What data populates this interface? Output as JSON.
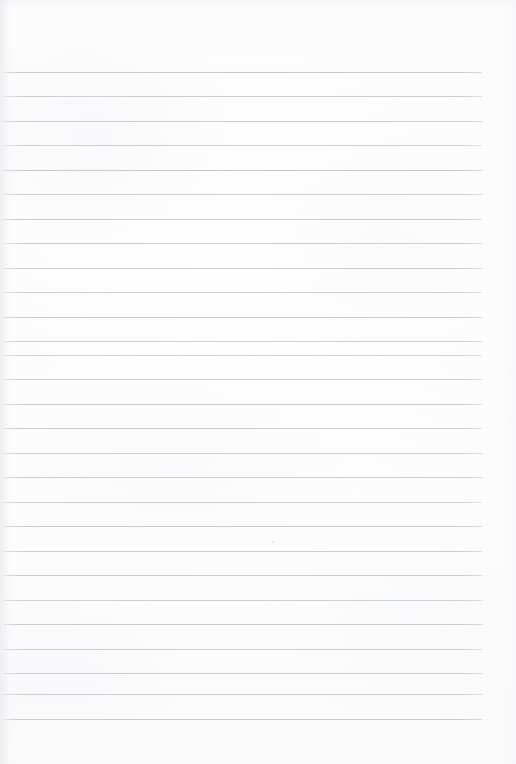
{
  "document": {
    "kind": "scanned-ruled-paper",
    "title": "Blank ruled notebook page",
    "content_text": "",
    "has_handwriting": false,
    "orientation": "portrait",
    "page_width_px": 516,
    "page_height_px": 764
  },
  "paper": {
    "background_color": "#fdfdfe",
    "edge_shadow_color": "#e1e3e8",
    "texture": "fine paper grain with soft scan vignette"
  },
  "ruling": {
    "style": "horizontal ruled lines",
    "line_color": "#b9bdc5",
    "line_color_light": "#d2d5db",
    "line_thickness_px": 1,
    "line_count": 27,
    "first_line_y": 72,
    "line_spacing_px": 24.5,
    "line_start_x": 3,
    "line_end_x": 483,
    "top_margin_px": 72,
    "bottom_margin_px": 44,
    "left_margin_px": 3,
    "right_margin_px": 33,
    "has_vertical_margin_rule": false
  },
  "lines": [
    {
      "index": 1,
      "y": 71.5,
      "x1": 4,
      "x2": 482,
      "opacity": 0.8
    },
    {
      "index": 2,
      "y": 96.0,
      "x1": 4,
      "x2": 483,
      "opacity": 0.72
    },
    {
      "index": 3,
      "y": 120.5,
      "x1": 3,
      "x2": 483,
      "opacity": 0.78
    },
    {
      "index": 4,
      "y": 145.0,
      "x1": 4,
      "x2": 482,
      "opacity": 0.7
    },
    {
      "index": 5,
      "y": 169.5,
      "x1": 3,
      "x2": 483,
      "opacity": 0.82
    },
    {
      "index": 6,
      "y": 194.0,
      "x1": 4,
      "x2": 483,
      "opacity": 0.74
    },
    {
      "index": 7,
      "y": 218.5,
      "x1": 3,
      "x2": 482,
      "opacity": 0.8
    },
    {
      "index": 8,
      "y": 243.0,
      "x1": 4,
      "x2": 483,
      "opacity": 0.72
    },
    {
      "index": 9,
      "y": 267.5,
      "x1": 3,
      "x2": 483,
      "opacity": 0.78
    },
    {
      "index": 10,
      "y": 292.0,
      "x1": 4,
      "x2": 482,
      "opacity": 0.7
    },
    {
      "index": 11,
      "y": 316.5,
      "x1": 3,
      "x2": 483,
      "opacity": 0.8
    },
    {
      "index": 12,
      "y": 341.0,
      "x1": 4,
      "x2": 483,
      "opacity": 0.74
    },
    {
      "index": 13,
      "y": 354.5,
      "x1": 3,
      "x2": 482,
      "opacity": 0.66
    },
    {
      "index": 14,
      "y": 379.0,
      "x1": 4,
      "x2": 483,
      "opacity": 0.78
    },
    {
      "index": 15,
      "y": 403.5,
      "x1": 3,
      "x2": 483,
      "opacity": 0.72
    },
    {
      "index": 16,
      "y": 428.0,
      "x1": 4,
      "x2": 482,
      "opacity": 0.8
    },
    {
      "index": 17,
      "y": 452.5,
      "x1": 3,
      "x2": 483,
      "opacity": 0.7
    },
    {
      "index": 18,
      "y": 477.0,
      "x1": 4,
      "x2": 483,
      "opacity": 0.78
    },
    {
      "index": 19,
      "y": 501.5,
      "x1": 3,
      "x2": 482,
      "opacity": 0.74
    },
    {
      "index": 20,
      "y": 526.0,
      "x1": 4,
      "x2": 483,
      "opacity": 0.8
    },
    {
      "index": 21,
      "y": 550.5,
      "x1": 3,
      "x2": 483,
      "opacity": 0.72
    },
    {
      "index": 22,
      "y": 575.0,
      "x1": 4,
      "x2": 482,
      "opacity": 0.78
    },
    {
      "index": 23,
      "y": 599.5,
      "x1": 3,
      "x2": 483,
      "opacity": 0.7
    },
    {
      "index": 24,
      "y": 624.0,
      "x1": 4,
      "x2": 483,
      "opacity": 0.8
    },
    {
      "index": 25,
      "y": 648.5,
      "x1": 3,
      "x2": 482,
      "opacity": 0.74
    },
    {
      "index": 26,
      "y": 673.0,
      "x1": 4,
      "x2": 483,
      "opacity": 0.78
    },
    {
      "index": 27,
      "y": 693.5,
      "x1": 3,
      "x2": 483,
      "opacity": 0.72
    },
    {
      "index": 28,
      "y": 718.5,
      "x1": 4,
      "x2": 482,
      "opacity": 0.82
    }
  ],
  "specks": [
    {
      "x": 272,
      "y": 541,
      "size": 2
    },
    {
      "x": 106,
      "y": 289,
      "size": 1
    },
    {
      "x": 151,
      "y": 386,
      "size": 1
    },
    {
      "x": 418,
      "y": 652,
      "size": 1
    }
  ]
}
